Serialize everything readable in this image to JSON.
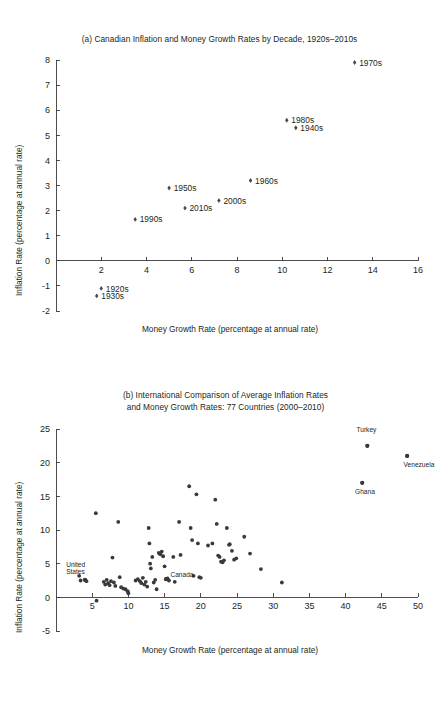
{
  "figure": {
    "background": "#ffffff",
    "ink": "#231f20",
    "marker_color": "#39393b"
  },
  "panel_a": {
    "title": "(a) Canadian Inflation and Money Growth Rates by Decade, 1920s–2010s",
    "xlabel": "Money Growth Rate (percentage at annual rate)",
    "ylabel": "Inflation Rate (percentage at annual rate)"
  },
  "panel_b": {
    "title_line1": "(b) International Comparison of Average Inflation Rates",
    "title_line2": "and Money Growth Rates: 77 Countries (2000–2010)",
    "xlabel": "Money Growth Rate (percentage at annual rate)",
    "ylabel": "Inflation Rate (percentage at annual rate)"
  },
  "chart_data": [
    {
      "type": "scatter",
      "id": "panel-a",
      "title": "(a) Canadian Inflation and Money Growth Rates by Decade, 1920s–2010s",
      "xlabel": "Money Growth Rate (percentage at annual rate)",
      "ylabel": "Inflation Rate (percentage at annual rate)",
      "xlim": [
        0,
        16
      ],
      "ylim": [
        -2,
        8
      ],
      "xticks": [
        2,
        4,
        6,
        8,
        10,
        12,
        14,
        16
      ],
      "yticks": [
        -2,
        -1,
        0,
        1,
        2,
        3,
        4,
        5,
        6,
        7,
        8
      ],
      "grid": false,
      "legend": "none",
      "marker": "diamond",
      "points": [
        {
          "label": "1920s",
          "x": 2.0,
          "y": -1.1,
          "label_pos": "right"
        },
        {
          "label": "1930s",
          "x": 1.8,
          "y": -1.4,
          "label_pos": "right"
        },
        {
          "label": "1940s",
          "x": 10.6,
          "y": 5.3,
          "label_pos": "right"
        },
        {
          "label": "1950s",
          "x": 5.0,
          "y": 2.9,
          "label_pos": "right"
        },
        {
          "label": "1960s",
          "x": 8.6,
          "y": 3.2,
          "label_pos": "right"
        },
        {
          "label": "1970s",
          "x": 13.2,
          "y": 7.9,
          "label_pos": "right"
        },
        {
          "label": "1980s",
          "x": 10.2,
          "y": 5.6,
          "label_pos": "right"
        },
        {
          "label": "1990s",
          "x": 3.5,
          "y": 1.65,
          "label_pos": "right"
        },
        {
          "label": "2000s",
          "x": 7.2,
          "y": 2.4,
          "label_pos": "right"
        },
        {
          "label": "2010s",
          "x": 5.7,
          "y": 2.1,
          "label_pos": "right"
        }
      ]
    },
    {
      "type": "scatter",
      "id": "panel-b",
      "title": "(b) International Comparison of Average Inflation Rates and Money Growth Rates: 77 Countries (2000–2010)",
      "xlabel": "Money Growth Rate (percentage at annual rate)",
      "ylabel": "Inflation Rate (percentage at annual rate)",
      "xlim": [
        0,
        50
      ],
      "ylim": [
        -5,
        25
      ],
      "xticks": [
        5,
        10,
        15,
        20,
        25,
        30,
        35,
        40,
        45,
        50
      ],
      "yticks": [
        -5,
        0,
        5,
        10,
        15,
        20,
        25
      ],
      "grid": false,
      "legend": "none",
      "marker": "circle",
      "annotations": [
        {
          "label": "Turkey",
          "x": 43.0,
          "y": 22.5,
          "label_dx": -1.5,
          "label_dy": 2.0
        },
        {
          "label": "Venezuela",
          "x": 48.5,
          "y": 21.0,
          "label_dx": -0.5,
          "label_dy": -1.6
        },
        {
          "label": "Ghana",
          "x": 42.3,
          "y": 17.0,
          "label_dx": -1.0,
          "label_dy": -1.7
        },
        {
          "label": "United States",
          "x": 4.0,
          "y": 2.6,
          "label_dx": -2.6,
          "label_dy": 1.9
        },
        {
          "label": "Canada",
          "x": 15.2,
          "y": 2.7,
          "label_dx": 0.6,
          "label_dy": 0.3
        }
      ],
      "points": [
        [
          3.2,
          3.2
        ],
        [
          3.4,
          2.5
        ],
        [
          4.0,
          2.6
        ],
        [
          4.2,
          2.4
        ],
        [
          5.5,
          12.5
        ],
        [
          5.6,
          -0.5
        ],
        [
          6.6,
          2.3
        ],
        [
          6.8,
          1.9
        ],
        [
          7.0,
          2.6
        ],
        [
          7.2,
          2.1
        ],
        [
          7.4,
          1.8
        ],
        [
          7.6,
          2.4
        ],
        [
          7.8,
          5.9
        ],
        [
          8.0,
          2.2
        ],
        [
          8.2,
          1.7
        ],
        [
          8.6,
          11.2
        ],
        [
          8.8,
          3.0
        ],
        [
          9.0,
          1.5
        ],
        [
          9.3,
          1.3
        ],
        [
          9.6,
          1.2
        ],
        [
          9.9,
          0.9
        ],
        [
          10.0,
          0.6
        ],
        [
          11.0,
          2.5
        ],
        [
          11.3,
          2.7
        ],
        [
          11.6,
          2.4
        ],
        [
          11.8,
          2.1
        ],
        [
          12.0,
          2.9
        ],
        [
          12.2,
          1.9
        ],
        [
          12.4,
          2.3
        ],
        [
          12.6,
          1.6
        ],
        [
          12.8,
          10.3
        ],
        [
          12.9,
          8.0
        ],
        [
          13.0,
          5.0
        ],
        [
          13.1,
          4.3
        ],
        [
          13.3,
          6.0
        ],
        [
          13.5,
          2.2
        ],
        [
          13.7,
          2.6
        ],
        [
          13.9,
          1.2
        ],
        [
          14.2,
          6.6
        ],
        [
          14.4,
          6.4
        ],
        [
          14.6,
          6.8
        ],
        [
          14.8,
          6.1
        ],
        [
          15.0,
          4.6
        ],
        [
          15.2,
          2.7
        ],
        [
          15.4,
          2.8
        ],
        [
          15.6,
          2.5
        ],
        [
          16.2,
          6.0
        ],
        [
          16.4,
          2.3
        ],
        [
          17.0,
          11.2
        ],
        [
          17.2,
          6.3
        ],
        [
          18.4,
          16.5
        ],
        [
          18.6,
          10.3
        ],
        [
          18.8,
          8.5
        ],
        [
          19.0,
          3.2
        ],
        [
          19.4,
          15.3
        ],
        [
          19.6,
          8.0
        ],
        [
          19.8,
          3.0
        ],
        [
          20.0,
          2.9
        ],
        [
          21.0,
          7.7
        ],
        [
          21.6,
          8.0
        ],
        [
          22.0,
          14.5
        ],
        [
          22.2,
          10.9
        ],
        [
          22.4,
          6.2
        ],
        [
          22.6,
          6.0
        ],
        [
          22.8,
          5.3
        ],
        [
          23.0,
          5.2
        ],
        [
          23.2,
          5.5
        ],
        [
          23.6,
          10.3
        ],
        [
          23.9,
          7.8
        ],
        [
          24.0,
          7.9
        ],
        [
          24.3,
          6.9
        ],
        [
          24.6,
          5.6
        ],
        [
          24.9,
          5.8
        ],
        [
          26.0,
          9.0
        ],
        [
          26.8,
          6.5
        ],
        [
          28.3,
          4.2
        ],
        [
          31.2,
          2.2
        ],
        [
          42.3,
          17.0
        ],
        [
          43.0,
          22.5
        ],
        [
          48.5,
          21.0
        ]
      ]
    }
  ]
}
